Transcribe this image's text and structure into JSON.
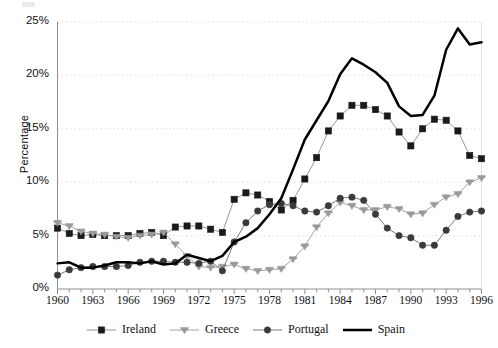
{
  "chart_data": {
    "type": "line",
    "title": "",
    "xlabel": "",
    "ylabel": "Percentage",
    "xlim": [
      1960,
      1996
    ],
    "ylim": [
      0,
      25
    ],
    "grid": true,
    "legend_position": "bottom",
    "ytick_labels": [
      "0%",
      "5%",
      "10%",
      "15%",
      "20%",
      "25%"
    ],
    "ytick_values": [
      0,
      5,
      10,
      15,
      20,
      25
    ],
    "xtick_labels": [
      "1960",
      "1963",
      "1966",
      "1969",
      "1972",
      "1975",
      "1978",
      "1981",
      "1984",
      "1987",
      "1990",
      "1993",
      "1996"
    ],
    "xtick_values": [
      1960,
      1963,
      1966,
      1969,
      1972,
      1975,
      1978,
      1981,
      1984,
      1987,
      1990,
      1993,
      1996
    ],
    "x": [
      1960,
      1961,
      1962,
      1963,
      1964,
      1965,
      1966,
      1967,
      1968,
      1969,
      1970,
      1971,
      1972,
      1973,
      1974,
      1975,
      1976,
      1977,
      1978,
      1979,
      1980,
      1981,
      1982,
      1983,
      1984,
      1985,
      1986,
      1987,
      1988,
      1989,
      1990,
      1991,
      1992,
      1993,
      1994,
      1995,
      1996
    ],
    "series": [
      {
        "name": "Ireland",
        "marker": "square",
        "color": "#1a1a1a",
        "line_color": "#8a8a8a",
        "values": [
          5.7,
          5.2,
          5.0,
          5.1,
          5.0,
          5.0,
          5.0,
          5.2,
          5.3,
          5.0,
          5.8,
          5.9,
          5.9,
          5.6,
          5.3,
          8.4,
          9.0,
          8.8,
          8.2,
          7.4,
          8.3,
          10.3,
          12.3,
          14.8,
          16.2,
          17.2,
          17.2,
          16.8,
          16.2,
          14.7,
          13.4,
          15.0,
          15.9,
          15.8,
          14.8,
          12.5,
          12.2
        ]
      },
      {
        "name": "Greece",
        "marker": "star",
        "color": "#9a9a9a",
        "line_color": "#9a9a9a",
        "values": [
          6.2,
          5.9,
          5.4,
          5.2,
          5.1,
          4.9,
          4.8,
          5.0,
          5.1,
          5.3,
          4.2,
          3.1,
          2.1,
          2.0,
          2.1,
          2.3,
          1.9,
          1.7,
          1.8,
          1.9,
          2.8,
          4.0,
          5.8,
          7.1,
          8.1,
          7.8,
          7.4,
          7.4,
          7.7,
          7.5,
          7.0,
          7.1,
          7.9,
          8.6,
          8.9,
          10.0,
          10.4
        ]
      },
      {
        "name": "Portugal",
        "marker": "circle",
        "color": "#3a3a3a",
        "line_color": "#6a6a6a",
        "values": [
          1.3,
          1.8,
          2.0,
          2.1,
          2.1,
          2.1,
          2.2,
          2.5,
          2.6,
          2.6,
          2.5,
          2.5,
          2.4,
          2.6,
          1.7,
          4.4,
          6.2,
          7.3,
          7.9,
          8.0,
          7.8,
          7.3,
          7.2,
          7.8,
          8.5,
          8.6,
          8.3,
          7.0,
          5.7,
          5.0,
          4.8,
          4.1,
          4.1,
          5.5,
          6.8,
          7.2,
          7.3
        ]
      },
      {
        "name": "Spain",
        "marker": "none",
        "color": "#000000",
        "line_color": "#000000",
        "values": [
          2.4,
          2.5,
          2.0,
          2.0,
          2.2,
          2.5,
          2.5,
          2.4,
          2.6,
          2.3,
          2.4,
          3.2,
          2.9,
          2.6,
          3.1,
          4.4,
          4.9,
          5.7,
          7.0,
          8.5,
          11.2,
          14.0,
          15.8,
          17.6,
          20.1,
          21.6,
          21.0,
          20.3,
          19.3,
          17.1,
          16.2,
          16.3,
          18.1,
          22.4,
          24.4,
          22.9,
          23.1
        ]
      }
    ]
  },
  "axes": {
    "ylabel": "Percentage"
  }
}
